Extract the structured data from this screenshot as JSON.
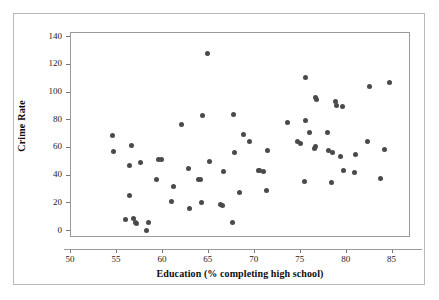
{
  "chart_data": {
    "type": "scatter",
    "title": "",
    "xlabel": "Education (% completing high school)",
    "ylabel": "Crime Rate",
    "xlim": [
      50,
      87
    ],
    "ylim": [
      -5,
      143
    ],
    "xticks": [
      50,
      55,
      60,
      65,
      70,
      75,
      80,
      85
    ],
    "yticks": [
      0,
      20,
      40,
      60,
      80,
      100,
      120,
      140
    ],
    "xtick_labels": [
      "50",
      "55",
      "60",
      "65",
      "70",
      "75",
      "80",
      "85"
    ],
    "ytick_labels": [
      "0",
      "20",
      "40",
      "60",
      "80",
      "100",
      "120",
      "140"
    ],
    "grid": false,
    "legend": null,
    "marker_color": "#4a4a4a",
    "marker_size": 5,
    "points": [
      {
        "x": 54.5,
        "y": 69.0
      },
      {
        "x": 54.6,
        "y": 57.5
      },
      {
        "x": 55.9,
        "y": 8.5
      },
      {
        "x": 56.4,
        "y": 47.0
      },
      {
        "x": 56.4,
        "y": 26.0
      },
      {
        "x": 56.6,
        "y": 62.0
      },
      {
        "x": 56.8,
        "y": 9.0
      },
      {
        "x": 57.0,
        "y": 6.5
      },
      {
        "x": 57.1,
        "y": 5.5
      },
      {
        "x": 57.6,
        "y": 49.5
      },
      {
        "x": 58.2,
        "y": 0.2
      },
      {
        "x": 58.4,
        "y": 6.5
      },
      {
        "x": 59.3,
        "y": 37.5
      },
      {
        "x": 59.5,
        "y": 51.5
      },
      {
        "x": 59.9,
        "y": 52.0
      },
      {
        "x": 60.9,
        "y": 21.5
      },
      {
        "x": 61.2,
        "y": 32.5
      },
      {
        "x": 62.0,
        "y": 77.0
      },
      {
        "x": 62.8,
        "y": 45.0
      },
      {
        "x": 62.9,
        "y": 16.0
      },
      {
        "x": 63.9,
        "y": 37.5
      },
      {
        "x": 64.1,
        "y": 37.0
      },
      {
        "x": 64.2,
        "y": 20.5
      },
      {
        "x": 64.3,
        "y": 83.5
      },
      {
        "x": 64.9,
        "y": 128.5
      },
      {
        "x": 65.1,
        "y": 50.5
      },
      {
        "x": 66.3,
        "y": 19.0
      },
      {
        "x": 66.5,
        "y": 18.5
      },
      {
        "x": 66.6,
        "y": 43.0
      },
      {
        "x": 67.6,
        "y": 6.5
      },
      {
        "x": 67.7,
        "y": 84.5
      },
      {
        "x": 67.8,
        "y": 56.5
      },
      {
        "x": 68.3,
        "y": 27.5
      },
      {
        "x": 68.8,
        "y": 69.5
      },
      {
        "x": 69.4,
        "y": 64.5
      },
      {
        "x": 70.4,
        "y": 44.0
      },
      {
        "x": 70.5,
        "y": 43.5
      },
      {
        "x": 70.9,
        "y": 43.0
      },
      {
        "x": 71.3,
        "y": 29.5
      },
      {
        "x": 71.4,
        "y": 58.5
      },
      {
        "x": 73.6,
        "y": 78.5
      },
      {
        "x": 74.6,
        "y": 64.5
      },
      {
        "x": 75.0,
        "y": 63.0
      },
      {
        "x": 75.4,
        "y": 36.0
      },
      {
        "x": 75.5,
        "y": 79.5
      },
      {
        "x": 75.5,
        "y": 111.0
      },
      {
        "x": 75.9,
        "y": 71.0
      },
      {
        "x": 76.5,
        "y": 59.5
      },
      {
        "x": 76.6,
        "y": 61.0
      },
      {
        "x": 76.6,
        "y": 96.5
      },
      {
        "x": 76.7,
        "y": 95.0
      },
      {
        "x": 77.9,
        "y": 71.0
      },
      {
        "x": 78.0,
        "y": 58.0
      },
      {
        "x": 78.4,
        "y": 35.0
      },
      {
        "x": 78.5,
        "y": 57.0
      },
      {
        "x": 78.8,
        "y": 93.5
      },
      {
        "x": 78.9,
        "y": 91.0
      },
      {
        "x": 79.3,
        "y": 54.0
      },
      {
        "x": 79.5,
        "y": 90.0
      },
      {
        "x": 79.6,
        "y": 44.0
      },
      {
        "x": 80.9,
        "y": 42.5
      },
      {
        "x": 81.0,
        "y": 55.0
      },
      {
        "x": 82.3,
        "y": 65.0
      },
      {
        "x": 82.5,
        "y": 104.5
      },
      {
        "x": 83.7,
        "y": 38.0
      },
      {
        "x": 84.1,
        "y": 59.0
      },
      {
        "x": 84.7,
        "y": 107.5
      }
    ]
  },
  "axes": {
    "xlabel_text": "Education (% completing high school)",
    "ylabel_text": "Crime Rate"
  }
}
